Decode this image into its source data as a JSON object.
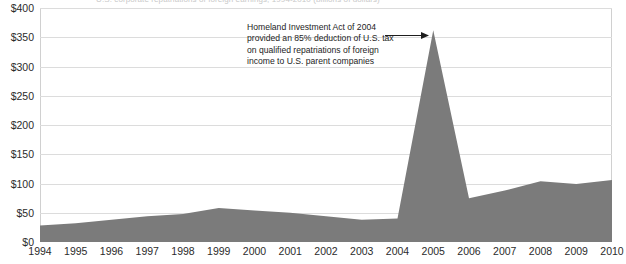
{
  "figure": {
    "clipped_title": "U.S. corporate repatriations of foreign earnings, 1994-2010 (billions of dollars)"
  },
  "annotation": {
    "lines": [
      "Homeland Investment Act of 2004",
      "provided an 85% deduction of U.S. tax",
      "on qualified repatriations of foreign",
      "income to U.S. parent companies"
    ],
    "arrow_icon": "arrow-right-icon"
  },
  "colors": {
    "area_fill": "#7b7b7b",
    "gridline": "#dcdcdc",
    "axis": "#8a8a8a",
    "text": "#2b2b2b"
  },
  "chart_data": {
    "type": "area",
    "title": "",
    "xlabel": "",
    "ylabel": "",
    "ylim": [
      0,
      400
    ],
    "ytick_labels": [
      "$0",
      "$50",
      "$100",
      "$150",
      "$200",
      "$250",
      "$300",
      "$350",
      "$400"
    ],
    "ytick_values": [
      0,
      50,
      100,
      150,
      200,
      250,
      300,
      350,
      400
    ],
    "grid": true,
    "legend": "none",
    "categories": [
      "1994",
      "1995",
      "1996",
      "1997",
      "1998",
      "1999",
      "2000",
      "2001",
      "2002",
      "2003",
      "2004",
      "2005",
      "2006",
      "2007",
      "2008",
      "2009",
      "2010"
    ],
    "values": [
      28,
      32,
      38,
      44,
      48,
      58,
      54,
      50,
      44,
      38,
      40,
      362,
      75,
      88,
      104,
      99,
      106
    ],
    "series": [
      {
        "name": "Repatriated foreign earnings",
        "values": [
          28,
          32,
          38,
          44,
          48,
          58,
          54,
          50,
          44,
          38,
          40,
          362,
          75,
          88,
          104,
          99,
          106
        ]
      }
    ],
    "annotations": [
      {
        "text": "Homeland Investment Act of 2004 provided an 85% deduction of U.S. tax on qualified repatriations of foreign income to U.S. parent companies",
        "points_to_category": "2005",
        "points_to_value": 362
      }
    ]
  }
}
